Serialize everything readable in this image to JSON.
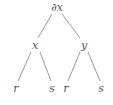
{
  "diagram": {
    "type": "tree",
    "colors": {
      "text": "#555555",
      "edge": "#9a9a9a",
      "background": "#ffffff"
    },
    "nodes": {
      "root": {
        "label": "∂x"
      },
      "left": {
        "label": "x"
      },
      "right": {
        "label": "y"
      },
      "left_left": {
        "label": "r"
      },
      "left_right": {
        "label": "s"
      },
      "right_left": {
        "label": "r"
      },
      "right_right": {
        "label": "s"
      }
    },
    "edges": [
      {
        "from": "root",
        "to": "left"
      },
      {
        "from": "root",
        "to": "right"
      },
      {
        "from": "left",
        "to": "left_left"
      },
      {
        "from": "left",
        "to": "left_right"
      },
      {
        "from": "right",
        "to": "right_left"
      },
      {
        "from": "right",
        "to": "right_right"
      }
    ]
  }
}
